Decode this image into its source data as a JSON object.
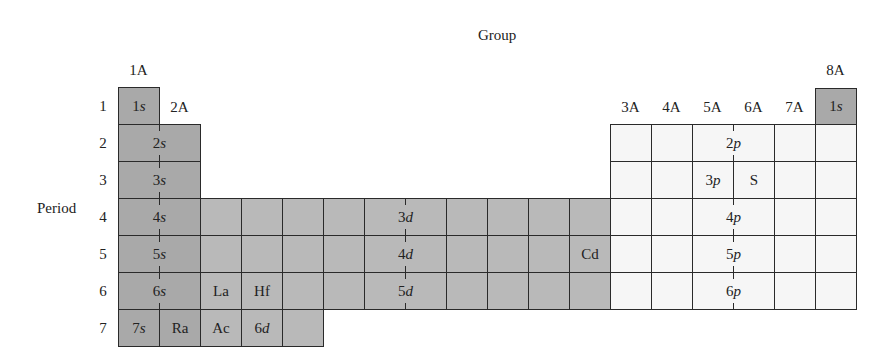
{
  "diagram": {
    "title_group": "Group",
    "title_period": "Period",
    "colors": {
      "s_block": "#a9a9a9",
      "d_block": "#b9b9b9",
      "p_block": "#f6f6f6",
      "line": "#2a2a2a"
    },
    "group_labels": [
      {
        "text": "1A",
        "column": 1
      },
      {
        "text": "2A",
        "column": 2
      },
      {
        "text": "3A",
        "column": 13
      },
      {
        "text": "4A",
        "column": 14
      },
      {
        "text": "5A",
        "column": 15
      },
      {
        "text": "6A",
        "column": 16
      },
      {
        "text": "7A",
        "column": 17
      },
      {
        "text": "8A",
        "column": 18
      }
    ],
    "period_labels": [
      "1",
      "2",
      "3",
      "4",
      "5",
      "6",
      "7"
    ],
    "cells": {
      "r1_1s": {
        "num": "1",
        "orb": "s"
      },
      "r1_8a_1s": {
        "num": "1",
        "orb": "s"
      },
      "r2_2s": {
        "num": "2",
        "orb": "s"
      },
      "r3_3s": {
        "num": "3",
        "orb": "s"
      },
      "r4_4s": {
        "num": "4",
        "orb": "s"
      },
      "r5_5s": {
        "num": "5",
        "orb": "s"
      },
      "r6_6s": {
        "num": "6",
        "orb": "s"
      },
      "r7_7s": {
        "num": "7",
        "orb": "s"
      },
      "r7_ra": "Ra",
      "r4_3d": {
        "num": "3",
        "orb": "d"
      },
      "r5_4d": {
        "num": "4",
        "orb": "d"
      },
      "r6_5d": {
        "num": "5",
        "orb": "d"
      },
      "r7_6d": {
        "num": "6",
        "orb": "d"
      },
      "r5_cd": "Cd",
      "r6_la": "La",
      "r6_hf": "Hf",
      "r7_ac": "Ac",
      "r2_2p": {
        "num": "2",
        "orb": "p"
      },
      "r3_3p": {
        "num": "3",
        "orb": "p"
      },
      "r3_s": "S",
      "r4_4p": {
        "num": "4",
        "orb": "p"
      },
      "r5_5p": {
        "num": "5",
        "orb": "p"
      },
      "r6_6p": {
        "num": "6",
        "orb": "p"
      }
    }
  }
}
